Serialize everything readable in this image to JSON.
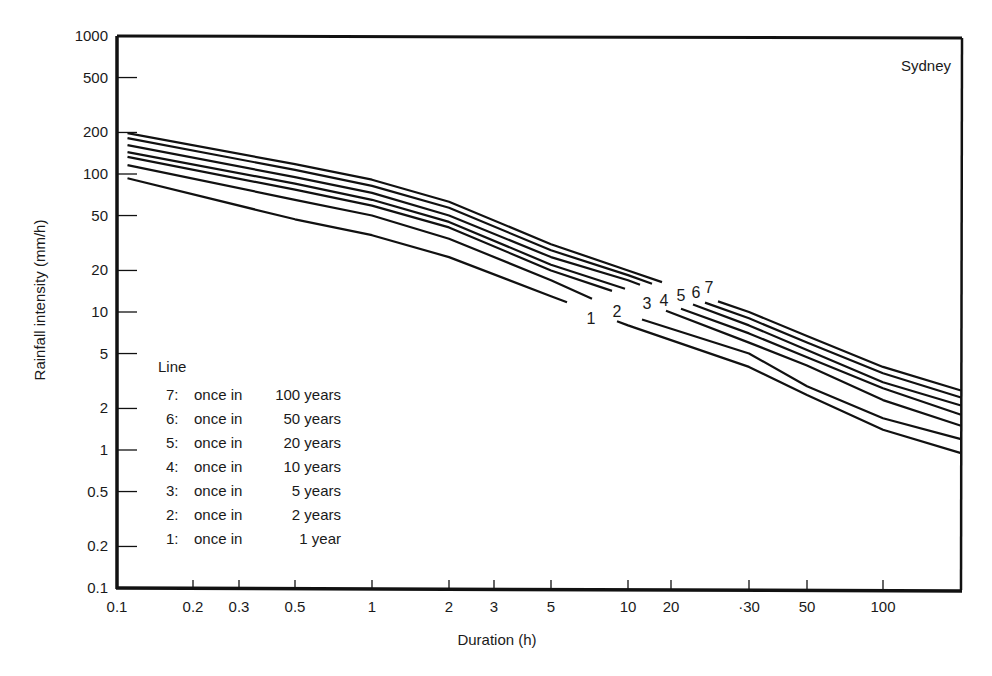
{
  "chart_data": {
    "type": "line",
    "title": "Sydney",
    "xlabel": "Duration (h)",
    "ylabel": "Rainfall intensity (mm/h)",
    "xscale": "log",
    "yscale": "log",
    "xlim": [
      0.1,
      200
    ],
    "ylim": [
      0.1,
      1000
    ],
    "grid": false,
    "x_ticks": [
      "0.1",
      "0.2",
      "0.3",
      "0.5",
      "1",
      "2",
      "3",
      "5",
      "10",
      "20",
      "·30",
      "50",
      "100"
    ],
    "y_ticks": [
      "1000",
      "500",
      "200",
      "100",
      "50",
      "20",
      "10",
      "5",
      "2",
      "1",
      "0.5",
      "0.2",
      "0.1"
    ],
    "x": [
      0.11,
      0.5,
      1,
      2,
      5,
      10,
      30,
      50,
      100,
      200
    ],
    "series": [
      {
        "name": "7: once in 100 years",
        "line": "7",
        "values": [
          198,
          118,
          91,
          63,
          31,
          20,
          10,
          6.7,
          4.0,
          2.7
        ]
      },
      {
        "name": "6: once in 50 years",
        "line": "6",
        "values": [
          182,
          107,
          82,
          57,
          28,
          18.5,
          9,
          6.0,
          3.6,
          2.4
        ]
      },
      {
        "name": "5: once in 20 years",
        "line": "5",
        "values": [
          162,
          95,
          73,
          50,
          25,
          17,
          8,
          5.3,
          3.1,
          2.1
        ]
      },
      {
        "name": "4: once in 10 years",
        "line": "4",
        "values": [
          144,
          85,
          65,
          45,
          22,
          14.5,
          7,
          4.7,
          2.8,
          1.8
        ]
      },
      {
        "name": "3: once in 5 years",
        "line": "3",
        "values": [
          133,
          77,
          59,
          41,
          20,
          13,
          6,
          4.1,
          2.3,
          1.5
        ]
      },
      {
        "name": "2: once in 2 years",
        "line": "2",
        "values": [
          116,
          65,
          50,
          34,
          17,
          9.5,
          5,
          2.9,
          1.7,
          1.2
        ]
      },
      {
        "name": "1: once in 1 year",
        "line": "1",
        "values": [
          93,
          47,
          36,
          25,
          13,
          8,
          4,
          2.5,
          1.4,
          0.95
        ]
      }
    ],
    "legend": {
      "title": "Line",
      "position": "lower-left inside",
      "entries": [
        {
          "num": "7:",
          "text": "once in",
          "period": "100 years"
        },
        {
          "num": "6:",
          "text": "once in",
          "period": "50 years"
        },
        {
          "num": "5:",
          "text": "once in",
          "period": "20 years"
        },
        {
          "num": "4:",
          "text": "once in",
          "period": "10 years"
        },
        {
          "num": "3:",
          "text": "once in",
          "period": "5 years"
        },
        {
          "num": "2:",
          "text": "once in",
          "period": "2 years"
        },
        {
          "num": "1:",
          "text": "once in",
          "period": "1 year"
        }
      ]
    },
    "annotations": [
      "Sydney",
      "1",
      "2",
      "3",
      "4",
      "5",
      "6",
      "7"
    ]
  },
  "colors": {
    "ink": "#111111",
    "background": "#ffffff"
  }
}
